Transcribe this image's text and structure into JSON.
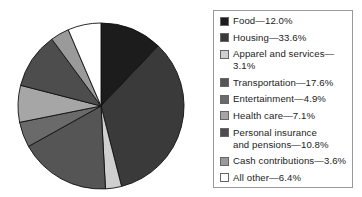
{
  "chart_data": {
    "type": "pie",
    "title": "",
    "start_angle_deg": 0,
    "direction": "clockwise",
    "legend_position": "right",
    "slices": [
      {
        "label": "Food",
        "value": 12.0,
        "color": "#1c1c1c",
        "legend_text": "Food—12.0%"
      },
      {
        "label": "Housing",
        "value": 33.6,
        "color": "#3a3a3a",
        "legend_text": "Housing—33.6%"
      },
      {
        "label": "Apparel and services",
        "value": 3.1,
        "color": "#cfcfcf",
        "legend_text": "Apparel and services—3.1%"
      },
      {
        "label": "Transportation",
        "value": 17.6,
        "color": "#555555",
        "legend_text": "Transportation—17.6%"
      },
      {
        "label": "Entertainment",
        "value": 4.9,
        "color": "#6a6a6a",
        "legend_text": "Entertainment—4.9%"
      },
      {
        "label": "Health care",
        "value": 7.1,
        "color": "#a6a6a6",
        "legend_text": "Health care—7.1%"
      },
      {
        "label": "Personal insurance and pensions",
        "value": 10.8,
        "color": "#4d4d4d",
        "legend_text": "Personal insurance\nand pensions—10.8%"
      },
      {
        "label": "Cash contributions",
        "value": 3.6,
        "color": "#9a9a9a",
        "legend_text": "Cash contributions—3.6%"
      },
      {
        "label": "All other",
        "value": 6.4,
        "color": "#ffffff",
        "legend_text": "All other—6.4%"
      }
    ]
  }
}
